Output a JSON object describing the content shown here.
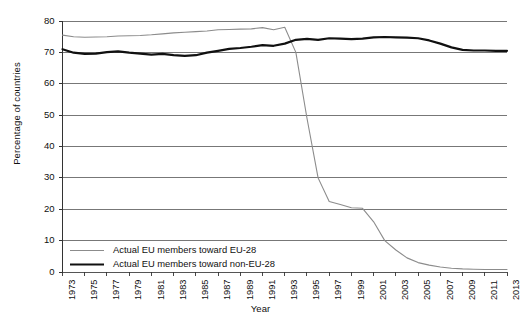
{
  "chart_data": {
    "type": "line",
    "title": "",
    "xlabel": "Year",
    "ylabel": "Percentage of countries",
    "xlim": [
      1973,
      2013
    ],
    "ylim": [
      0,
      80
    ],
    "grid": true,
    "legend_position": "bottom-left",
    "y_ticks": [
      0,
      10,
      20,
      30,
      40,
      50,
      60,
      70,
      80
    ],
    "x_ticks": [
      1973,
      1975,
      1977,
      1979,
      1981,
      1983,
      1985,
      1987,
      1989,
      1991,
      1993,
      1995,
      1997,
      1999,
      2001,
      2003,
      2005,
      2007,
      2009,
      2011,
      2013
    ],
    "x": [
      1973,
      1974,
      1975,
      1976,
      1977,
      1978,
      1979,
      1980,
      1981,
      1982,
      1983,
      1984,
      1985,
      1986,
      1987,
      1988,
      1989,
      1990,
      1991,
      1992,
      1993,
      1994,
      1995,
      1996,
      1997,
      1998,
      1999,
      2000,
      2001,
      2002,
      2003,
      2004,
      2005,
      2006,
      2007,
      2008,
      2009,
      2010,
      2011,
      2012,
      2013
    ],
    "series": [
      {
        "name": "Actual EU members toward EU-28",
        "color": "#8c8c8c",
        "width": 1.1,
        "values": [
          75.5,
          75.0,
          74.8,
          74.9,
          75.0,
          75.2,
          75.3,
          75.4,
          75.6,
          75.9,
          76.2,
          76.4,
          76.6,
          76.8,
          77.2,
          77.3,
          77.4,
          77.5,
          77.9,
          77.2,
          78.0,
          70.0,
          49.0,
          30.0,
          22.5,
          21.5,
          20.5,
          20.3,
          16.0,
          10.0,
          7.0,
          4.5,
          3.0,
          2.2,
          1.6,
          1.2,
          1.0,
          0.9,
          0.8,
          0.8,
          0.8
        ]
      },
      {
        "name": "Actual EU members toward non-EU-28",
        "color": "#101010",
        "width": 2.2,
        "values": [
          71.0,
          69.9,
          69.5,
          69.6,
          70.1,
          70.3,
          69.9,
          69.6,
          69.3,
          69.5,
          69.1,
          68.9,
          69.1,
          69.9,
          70.5,
          71.1,
          71.4,
          71.8,
          72.3,
          72.1,
          72.8,
          74.0,
          74.3,
          74.0,
          74.5,
          74.4,
          74.2,
          74.4,
          74.8,
          74.9,
          74.8,
          74.7,
          74.5,
          73.8,
          72.8,
          71.6,
          70.8,
          70.6,
          70.6,
          70.5,
          70.5
        ]
      }
    ],
    "legend": [
      {
        "label": "Actual EU members toward EU-28",
        "color": "#8c8c8c",
        "width": 1.1
      },
      {
        "label": "Actual EU members toward non-EU-28",
        "color": "#101010",
        "width": 2.2
      }
    ]
  },
  "axes": {
    "y_title": "Percentage of countries",
    "x_title": "Year"
  }
}
